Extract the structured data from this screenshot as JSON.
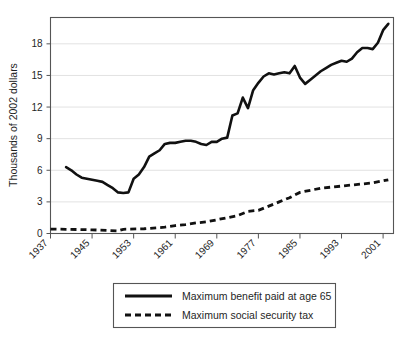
{
  "chart_data": {
    "type": "line",
    "title": "",
    "xlabel": "",
    "ylabel": "Thousands of 2002 dollars",
    "xlim": [
      1937,
      2003
    ],
    "ylim": [
      0,
      20.5
    ],
    "yticks": [
      0,
      3,
      6,
      9,
      12,
      15,
      18
    ],
    "ytick_labels": [
      "0",
      "3",
      "6",
      "9",
      "12",
      "15",
      "18"
    ],
    "xticks": [
      1937,
      1945,
      1953,
      1961,
      1969,
      1977,
      1985,
      1993,
      2001
    ],
    "xtick_labels": [
      "1937",
      "1945",
      "1953",
      "1961",
      "1969",
      "1977",
      "1985",
      "1993",
      "2001"
    ],
    "grid": "horizontal",
    "legend_position": "below-center",
    "series": [
      {
        "name": "Maximum benefit paid at age 65",
        "style": "solid",
        "color": "#111111",
        "x": [
          1940,
          1941,
          1942,
          1943,
          1944,
          1945,
          1946,
          1947,
          1948,
          1949,
          1950,
          1951,
          1952,
          1953,
          1954,
          1955,
          1956,
          1957,
          1958,
          1959,
          1960,
          1961,
          1962,
          1963,
          1964,
          1965,
          1966,
          1967,
          1968,
          1969,
          1970,
          1971,
          1972,
          1973,
          1974,
          1975,
          1976,
          1977,
          1978,
          1979,
          1980,
          1981,
          1982,
          1983,
          1984,
          1985,
          1986,
          1987,
          1988,
          1989,
          1990,
          1991,
          1992,
          1993,
          1994,
          1995,
          1996,
          1997,
          1998,
          1999,
          2000,
          2001,
          2002
        ],
        "values": [
          6.3,
          6.0,
          5.6,
          5.3,
          5.2,
          5.1,
          5.0,
          4.9,
          4.6,
          4.3,
          3.9,
          3.85,
          3.9,
          5.2,
          5.6,
          6.3,
          7.3,
          7.6,
          7.9,
          8.5,
          8.6,
          8.6,
          8.7,
          8.8,
          8.8,
          8.7,
          8.5,
          8.4,
          8.7,
          8.7,
          9.0,
          9.1,
          11.2,
          11.4,
          12.9,
          11.9,
          13.6,
          14.3,
          14.9,
          15.2,
          15.1,
          15.2,
          15.3,
          15.2,
          15.9,
          14.8,
          14.2,
          14.6,
          15.0,
          15.4,
          15.7,
          16.0,
          16.2,
          16.4,
          16.3,
          16.6,
          17.2,
          17.6,
          17.6,
          17.5,
          18.1,
          19.3,
          19.9
        ]
      },
      {
        "name": "Maximum social security tax",
        "style": "dashed",
        "color": "#111111",
        "x": [
          1937,
          1940,
          1945,
          1950,
          1951,
          1955,
          1959,
          1961,
          1963,
          1965,
          1967,
          1969,
          1971,
          1973,
          1975,
          1977,
          1979,
          1981,
          1983,
          1985,
          1987,
          1989,
          1991,
          1993,
          1995,
          1997,
          1999,
          2001,
          2002
        ],
        "values": [
          0.42,
          0.4,
          0.35,
          0.25,
          0.4,
          0.45,
          0.6,
          0.75,
          0.85,
          1.0,
          1.1,
          1.3,
          1.5,
          1.7,
          2.1,
          2.2,
          2.6,
          3.0,
          3.4,
          3.9,
          4.1,
          4.3,
          4.4,
          4.5,
          4.6,
          4.7,
          4.8,
          5.0,
          5.1
        ]
      }
    ]
  },
  "legend": {
    "items": [
      {
        "label": "Maximum benefit paid at age 65",
        "style": "solid"
      },
      {
        "label": "Maximum social security tax",
        "style": "dashed"
      }
    ]
  }
}
